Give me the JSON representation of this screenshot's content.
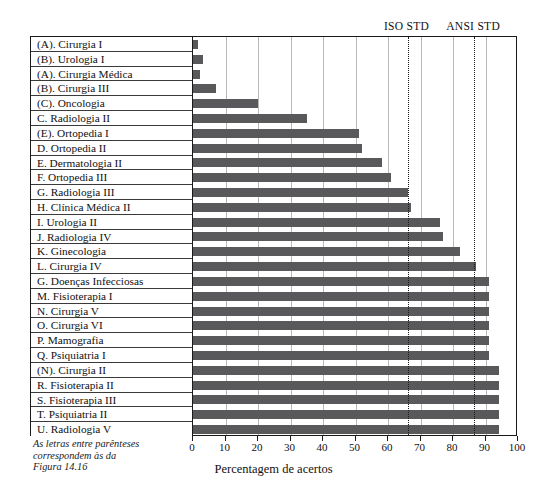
{
  "figure": {
    "xlabel": "Percentagem de acertos",
    "footnote_lines": [
      "As letras entre parênteses",
      "correspondem às da",
      "Figura 14.16"
    ],
    "bar_color": "#59595b",
    "frame_color": "#1a1a1a",
    "grid_color": "#b9b9b9"
  },
  "chart_data": {
    "type": "bar",
    "orientation": "horizontal",
    "title": "",
    "xlabel": "Percentagem de acertos",
    "ylabel": "",
    "xlim": [
      0,
      100
    ],
    "grid": true,
    "legend": null,
    "tick_labels": [
      "0",
      "10",
      "20",
      "30",
      "40",
      "50",
      "60",
      "70",
      "80",
      "90",
      "100"
    ],
    "ticks": [
      0,
      10,
      20,
      30,
      40,
      50,
      60,
      70,
      80,
      90,
      100
    ],
    "categories": [
      "(A). Cirurgia I",
      "(B). Urologia I",
      "(A). Cirurgia Médica",
      "(B). Cirurgia III",
      "(C). Oncologia",
      "C. Radiologia II",
      "(E). Ortopedia I",
      "D. Ortopedia II",
      "E. Dermatologia II",
      "F. Ortopedia III",
      "G. Radiologia III",
      "H. Clínica Médica II",
      "I. Urologia II",
      "J. Radiologia IV",
      "K. Ginecologia",
      "L. Cirurgia IV",
      "G. Doenças Infecciosas",
      "M. Fisioterapia I",
      "N. Cirurgia V",
      "O. Cirurgia VI",
      "P. Mamografia",
      "Q. Psiquiatria I",
      "(N). Cirurgia II",
      "R. Fisioterapia II",
      "S. Fisioterapia III",
      "T. Psiquiatria II",
      "U. Radiologia V"
    ],
    "values": [
      1.5,
      3.0,
      2.0,
      7.0,
      20.0,
      35.0,
      51.0,
      52.0,
      58.0,
      61.0,
      66.0,
      67.0,
      76.0,
      77.0,
      82.0,
      87.0,
      91.0,
      91.0,
      91.0,
      91.0,
      91.0,
      91.0,
      94.0,
      94.0,
      94.0,
      94.0,
      94.0
    ],
    "reference_lines": [
      {
        "label": "ISO STD",
        "value": 66.0,
        "style": "dotted"
      },
      {
        "label": "ANSI STD",
        "value": 86.5,
        "style": "dotted"
      }
    ],
    "annotations": [
      "As letras entre parênteses correspondem às da Figura 14.16"
    ]
  }
}
